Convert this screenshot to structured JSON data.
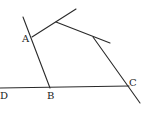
{
  "diagram": {
    "type": "geometry",
    "labels": {
      "A": "A",
      "B": "B",
      "C": "C",
      "D": "D"
    },
    "colors": {
      "stroke": "#2a2a2a",
      "text": "#222222",
      "background": "#ffffff"
    },
    "points": {
      "A": [
        32,
        37
      ],
      "B": [
        50,
        88
      ],
      "C": [
        128,
        86
      ],
      "D": [
        2,
        88
      ],
      "P1": [
        56,
        22
      ],
      "P2": [
        93,
        37
      ]
    },
    "segments": [
      {
        "name": "line-AB",
        "from": "A",
        "to": "B",
        "extends_beyond": "A"
      },
      {
        "name": "line-DC",
        "from": "D",
        "to": "C"
      },
      {
        "name": "segment-A-P1",
        "from": "A",
        "to": "P1",
        "extends_beyond": "P1"
      },
      {
        "name": "segment-P1-P2",
        "from": "P1",
        "to": "P2",
        "extends_beyond": "P2"
      },
      {
        "name": "segment-P2-C",
        "from": "P2",
        "to": "C",
        "extends_beyond": "C"
      }
    ]
  }
}
